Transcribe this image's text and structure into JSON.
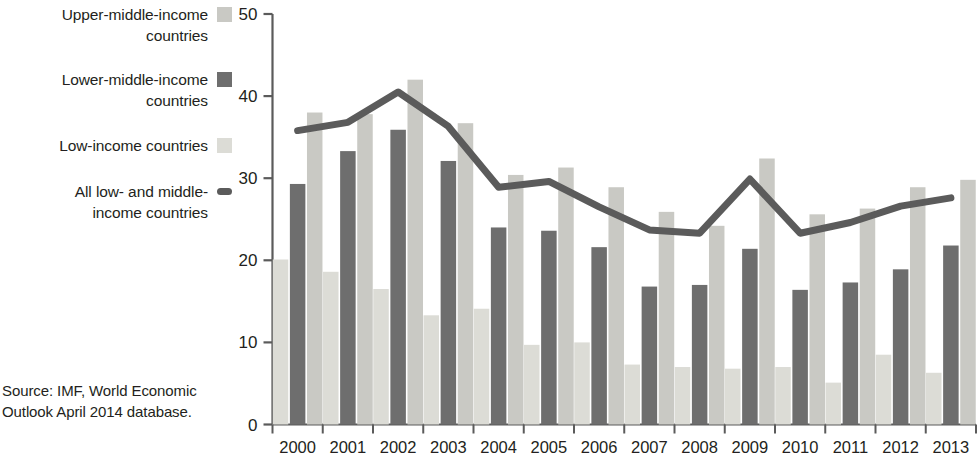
{
  "legend": {
    "items": [
      {
        "label": "Upper-middle-income countries",
        "type": "swatch",
        "color": "#c9c9c4"
      },
      {
        "label": "Lower-middle-income countries",
        "type": "swatch",
        "color": "#6e6e6e"
      },
      {
        "label": "Low-income countries",
        "type": "swatch",
        "color": "#dcdcd6"
      },
      {
        "label": "All low- and middle-income countries",
        "type": "line",
        "color": "#5b5b5b"
      }
    ]
  },
  "source": {
    "text": "Source:  IMF, World Economic Outlook April 2014 database."
  },
  "chart_data": {
    "type": "bar",
    "title": "",
    "xlabel": "",
    "ylabel": "",
    "ylim": [
      0,
      50
    ],
    "yticks": [
      0,
      10,
      20,
      30,
      40,
      50
    ],
    "grid": false,
    "legend_position": "left",
    "categories": [
      "2000",
      "2001",
      "2002",
      "2003",
      "2004",
      "2005",
      "2006",
      "2007",
      "2008",
      "2009",
      "2010",
      "2011",
      "2012",
      "2013"
    ],
    "series": [
      {
        "name": "Low-income countries",
        "kind": "bar",
        "color": "#dcdcd6",
        "values": [
          20.1,
          18.6,
          16.5,
          13.3,
          14.1,
          9.7,
          10.0,
          7.3,
          7.0,
          6.8,
          7.0,
          5.1,
          8.5,
          6.3
        ]
      },
      {
        "name": "Lower-middle-income countries",
        "kind": "bar",
        "color": "#6e6e6e",
        "values": [
          29.3,
          33.3,
          35.9,
          32.1,
          24.0,
          23.6,
          21.6,
          16.8,
          17.0,
          21.4,
          16.4,
          17.3,
          18.9,
          21.8
        ]
      },
      {
        "name": "Upper-middle-income countries",
        "kind": "bar",
        "color": "#c9c9c4",
        "values": [
          38.0,
          37.8,
          42.0,
          36.7,
          30.4,
          31.3,
          28.9,
          25.9,
          24.2,
          32.4,
          25.6,
          26.3,
          28.9,
          29.8
        ]
      },
      {
        "name": "All low- and middle-income countries",
        "kind": "line",
        "color": "#5b5b5b",
        "values": [
          35.8,
          36.8,
          40.5,
          36.3,
          28.9,
          29.6,
          26.5,
          23.7,
          23.3,
          29.9,
          23.3,
          24.6,
          26.6,
          27.6
        ]
      }
    ]
  }
}
